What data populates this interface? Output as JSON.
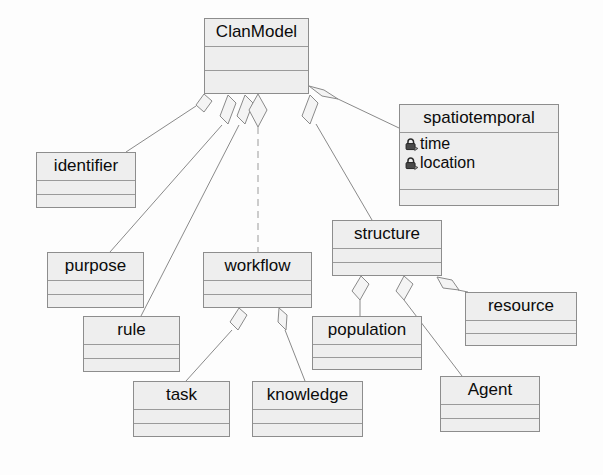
{
  "diagram": {
    "type": "uml-class-diagram",
    "root": "ClanModel",
    "colors": {
      "class_fill": "#eeeeee",
      "class_border": "#8d8d8d",
      "edge": "#8a8a8a",
      "text": "#0b0b0b",
      "canvas": "#fdfdfd"
    },
    "classes": [
      {
        "id": "clanmodel",
        "name": "ClanModel",
        "attributes": [],
        "x": 204,
        "y": 18,
        "w": 105,
        "h": 76
      },
      {
        "id": "spatiotemporal",
        "name": "spatiotemporal",
        "attributes": [
          {
            "label": "time",
            "icon": "lock-icon",
            "visibility": "private"
          },
          {
            "label": "location",
            "icon": "lock-icon",
            "visibility": "private"
          }
        ],
        "x": 399,
        "y": 104,
        "w": 160,
        "h": 102
      },
      {
        "id": "identifier",
        "name": "identifier",
        "attributes": [],
        "x": 36,
        "y": 152,
        "w": 100,
        "h": 56
      },
      {
        "id": "purpose",
        "name": "purpose",
        "attributes": [],
        "x": 47,
        "y": 252,
        "w": 97,
        "h": 56
      },
      {
        "id": "workflow",
        "name": "workflow",
        "attributes": [],
        "x": 203,
        "y": 252,
        "w": 109,
        "h": 56
      },
      {
        "id": "structure",
        "name": "structure",
        "attributes": [],
        "x": 332,
        "y": 220,
        "w": 110,
        "h": 56
      },
      {
        "id": "rule",
        "name": "rule",
        "attributes": [],
        "x": 83,
        "y": 316,
        "w": 97,
        "h": 56
      },
      {
        "id": "population",
        "name": "population",
        "attributes": [],
        "x": 312,
        "y": 316,
        "w": 110,
        "h": 54
      },
      {
        "id": "resource",
        "name": "resource",
        "attributes": [],
        "x": 465,
        "y": 292,
        "w": 112,
        "h": 54
      },
      {
        "id": "task",
        "name": "task",
        "attributes": [],
        "x": 133,
        "y": 381,
        "w": 97,
        "h": 56
      },
      {
        "id": "knowledge",
        "name": "knowledge",
        "attributes": [],
        "x": 252,
        "y": 381,
        "w": 111,
        "h": 56
      },
      {
        "id": "agent",
        "name": "Agent",
        "attributes": [],
        "x": 440,
        "y": 376,
        "w": 100,
        "h": 56
      }
    ],
    "associations": [
      {
        "from": "clanmodel",
        "to": "identifier",
        "kind": "aggregation",
        "label": ""
      },
      {
        "from": "clanmodel",
        "to": "purpose",
        "kind": "aggregation",
        "label": ""
      },
      {
        "from": "clanmodel",
        "to": "rule",
        "kind": "aggregation",
        "label": ""
      },
      {
        "from": "clanmodel",
        "to": "workflow",
        "kind": "aggregation",
        "label": ""
      },
      {
        "from": "clanmodel",
        "to": "structure",
        "kind": "aggregation",
        "label": ""
      },
      {
        "from": "clanmodel",
        "to": "spatiotemporal",
        "kind": "aggregation",
        "label": ""
      },
      {
        "from": "workflow",
        "to": "task",
        "kind": "aggregation",
        "label": ""
      },
      {
        "from": "workflow",
        "to": "knowledge",
        "kind": "aggregation",
        "label": ""
      },
      {
        "from": "structure",
        "to": "population",
        "kind": "aggregation",
        "label": ""
      },
      {
        "from": "structure",
        "to": "agent",
        "kind": "aggregation",
        "label": ""
      },
      {
        "from": "structure",
        "to": "resource",
        "kind": "aggregation",
        "label": ""
      }
    ]
  }
}
